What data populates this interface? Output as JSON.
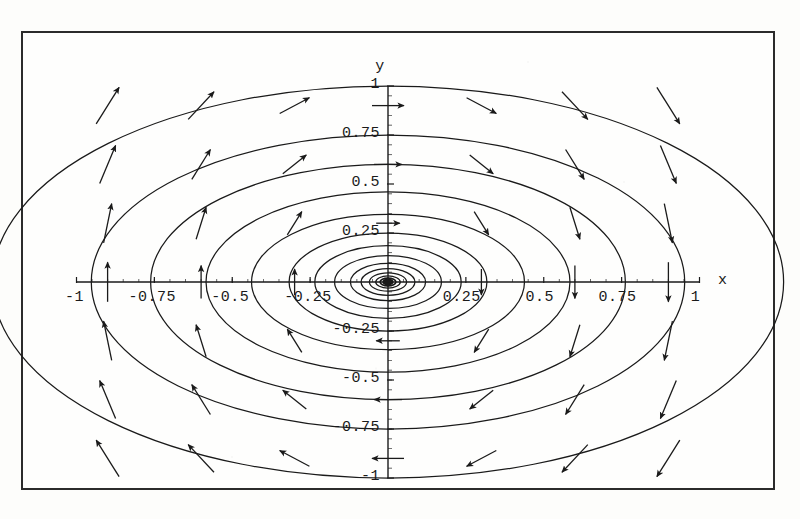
{
  "figure": {
    "kind": "phase-portrait",
    "frame": {
      "x": 21,
      "y": 31,
      "width": 754,
      "height": 459,
      "border_color": "#2b2b2b"
    },
    "background_color": "#fefefd",
    "ink_color": "#1a1a1a"
  },
  "axes": {
    "x_label": "x",
    "y_label": "y",
    "origin_px": {
      "x": 388,
      "y": 282
    },
    "x_px": {
      "min": 77,
      "max": 700
    },
    "y_px": {
      "min": 86,
      "max": 478
    },
    "x_ticks": [
      {
        "value": -1,
        "label": "-1"
      },
      {
        "value": -0.75,
        "label": "-0.75"
      },
      {
        "value": -0.5,
        "label": "-0.5"
      },
      {
        "value": -0.25,
        "label": "-0.25"
      },
      {
        "value": 0.25,
        "label": "0.25"
      },
      {
        "value": 0.5,
        "label": "0.5"
      },
      {
        "value": 0.75,
        "label": "0.75"
      },
      {
        "value": 1,
        "label": "1"
      }
    ],
    "y_ticks": [
      {
        "value": 1,
        "label": "1"
      },
      {
        "value": 0.75,
        "label": "0.75"
      },
      {
        "value": 0.5,
        "label": "0.5"
      },
      {
        "value": 0.25,
        "label": "0.25"
      },
      {
        "value": -0.25,
        "label": "-0.25"
      },
      {
        "value": -0.5,
        "label": "-0.5"
      },
      {
        "value": -0.75,
        "label": "-0.75"
      },
      {
        "value": -1,
        "label": "-1"
      }
    ],
    "minor_ticks_per_interval": 5
  },
  "chart_data": {
    "type": "line",
    "title": "",
    "xlabel": "x",
    "ylabel": "y",
    "xlim": [
      -1.08,
      1.12
    ],
    "ylim": [
      -1.12,
      1.12
    ],
    "grid": false,
    "legend": "none",
    "fixed_point": {
      "x": 0,
      "y": 0,
      "type": "center"
    },
    "rotation": "clockwise",
    "orbits": {
      "shape": "ellipse",
      "aspect_ratio_x_over_y": 1.27,
      "semi_minor_y_values": [
        1.0,
        0.75,
        0.6,
        0.46,
        0.345,
        0.25,
        0.185,
        0.135,
        0.095,
        0.068,
        0.047,
        0.031,
        0.02,
        0.012,
        0.007,
        0.004,
        0.002
      ],
      "count": 17
    },
    "vector_field": {
      "formula": "dx/dt = y, dy/dt = -1.6 x",
      "grid_nx": 9,
      "grid_ny": 9,
      "arrow_color": "#111111",
      "arrows": [
        {
          "x": -0.9,
          "y": 0.9
        },
        {
          "x": -0.6,
          "y": 0.9
        },
        {
          "x": -0.3,
          "y": 0.9
        },
        {
          "x": 0.0,
          "y": 0.9
        },
        {
          "x": 0.3,
          "y": 0.9
        },
        {
          "x": 0.6,
          "y": 0.9
        },
        {
          "x": 0.9,
          "y": 0.9
        },
        {
          "x": -0.9,
          "y": 0.6
        },
        {
          "x": -0.6,
          "y": 0.6
        },
        {
          "x": -0.3,
          "y": 0.6
        },
        {
          "x": 0.0,
          "y": 0.6
        },
        {
          "x": 0.3,
          "y": 0.6
        },
        {
          "x": 0.6,
          "y": 0.6
        },
        {
          "x": 0.9,
          "y": 0.6
        },
        {
          "x": -0.9,
          "y": 0.3
        },
        {
          "x": -0.6,
          "y": 0.3
        },
        {
          "x": -0.3,
          "y": 0.3
        },
        {
          "x": 0.0,
          "y": 0.3
        },
        {
          "x": 0.3,
          "y": 0.3
        },
        {
          "x": 0.6,
          "y": 0.3
        },
        {
          "x": 0.9,
          "y": 0.3
        },
        {
          "x": -0.9,
          "y": 0.0
        },
        {
          "x": -0.6,
          "y": 0.0
        },
        {
          "x": -0.3,
          "y": 0.0
        },
        {
          "x": 0.3,
          "y": 0.0
        },
        {
          "x": 0.6,
          "y": 0.0
        },
        {
          "x": 0.9,
          "y": 0.0
        },
        {
          "x": -0.9,
          "y": -0.3
        },
        {
          "x": -0.6,
          "y": -0.3
        },
        {
          "x": -0.3,
          "y": -0.3
        },
        {
          "x": 0.0,
          "y": -0.3
        },
        {
          "x": 0.3,
          "y": -0.3
        },
        {
          "x": 0.6,
          "y": -0.3
        },
        {
          "x": 0.9,
          "y": -0.3
        },
        {
          "x": -0.9,
          "y": -0.6
        },
        {
          "x": -0.6,
          "y": -0.6
        },
        {
          "x": -0.3,
          "y": -0.6
        },
        {
          "x": 0.0,
          "y": -0.6
        },
        {
          "x": 0.3,
          "y": -0.6
        },
        {
          "x": 0.6,
          "y": -0.6
        },
        {
          "x": 0.9,
          "y": -0.6
        },
        {
          "x": -0.9,
          "y": -0.9
        },
        {
          "x": -0.6,
          "y": -0.9
        },
        {
          "x": -0.3,
          "y": -0.9
        },
        {
          "x": 0.0,
          "y": -0.9
        },
        {
          "x": 0.3,
          "y": -0.9
        },
        {
          "x": 0.6,
          "y": -0.9
        },
        {
          "x": 0.9,
          "y": -0.9
        }
      ]
    }
  }
}
